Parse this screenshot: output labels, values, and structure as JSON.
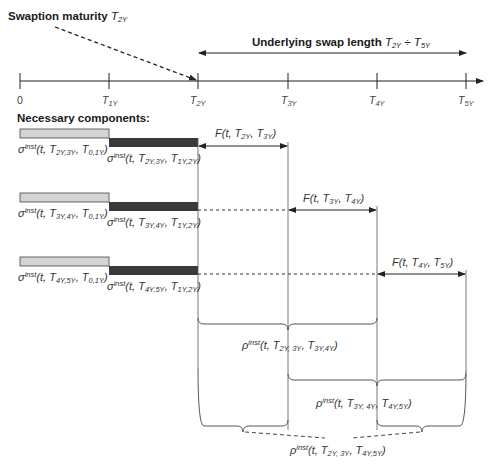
{
  "title": {
    "swaption_maturity_text": "Swaption maturity",
    "swaption_maturity_symbol": "T",
    "swaption_maturity_sub": "2Y",
    "underlying_text": "Underlying swap length",
    "underlying_from": "T",
    "underlying_from_sub": "2Y",
    "underlying_sep": " ÷ ",
    "underlying_to": "T",
    "underlying_to_sub": "5Y"
  },
  "axis": {
    "ticks": [
      {
        "label": "0",
        "sub": ""
      },
      {
        "label": "T",
        "sub": "1Y"
      },
      {
        "label": "T",
        "sub": "2Y"
      },
      {
        "label": "T",
        "sub": "3Y"
      },
      {
        "label": "T",
        "sub": "4Y"
      },
      {
        "label": "T",
        "sub": "5Y"
      }
    ]
  },
  "components_heading": "Necessary components:",
  "rows": [
    {
      "sigma1": {
        "pre": "σ",
        "sup": "inst",
        "args": "(t, T",
        "s1": "2Y,3Y",
        "mid": ", T",
        "s2": "0,1Y",
        "end": ")"
      },
      "sigma2": {
        "pre": "σ",
        "sup": "inst",
        "args": "(t, T",
        "s1": "2Y,3Y",
        "mid": ", T",
        "s2": "1Y,2Y",
        "end": ")"
      },
      "forward": {
        "pre": "F(t, T",
        "s1": "2Y",
        "mid": ", T",
        "s2": "3Y",
        "end": ")"
      }
    },
    {
      "sigma1": {
        "pre": "σ",
        "sup": "inst",
        "args": "(t, T",
        "s1": "3Y,4Y",
        "mid": ", T",
        "s2": "0,1Y",
        "end": ")"
      },
      "sigma2": {
        "pre": "σ",
        "sup": "inst",
        "args": "(t, T",
        "s1": "3Y,4Y",
        "mid": ", T",
        "s2": "1Y,2Y",
        "end": ")"
      },
      "forward": {
        "pre": "F(t, T",
        "s1": "3Y",
        "mid": ", T",
        "s2": "4Y",
        "end": ")"
      }
    },
    {
      "sigma1": {
        "pre": "σ",
        "sup": "inst",
        "args": "(t, T",
        "s1": "4Y,5Y",
        "mid": ", T",
        "s2": "0,1Y",
        "end": ")"
      },
      "sigma2": {
        "pre": "σ",
        "sup": "inst",
        "args": "(t, T",
        "s1": "4Y,5Y",
        "mid": ", T",
        "s2": "1Y,2Y",
        "end": ")"
      },
      "forward": {
        "pre": "F(t, T",
        "s1": "4Y",
        "mid": ", T",
        "s2": "5Y",
        "end": ")"
      }
    }
  ],
  "correlations": [
    {
      "pre": "ρ",
      "sup": "inst",
      "args": "(t, T",
      "s1": "2Y, 3Y",
      "mid": ", T",
      "s2": "3Y,4Y",
      "end": ")"
    },
    {
      "pre": "ρ",
      "sup": "inst",
      "args": "(t, T",
      "s1": "3Y, 4Y",
      "mid": ", T",
      "s2": "4Y,5Y",
      "end": ")"
    },
    {
      "pre": "ρ",
      "sup": "inst",
      "args": "(t, T",
      "s1": "2Y, 3Y",
      "mid": ", T",
      "s2": "4Y,5Y",
      "end": ")"
    }
  ],
  "colors": {
    "light_bar": "#d4d4d4",
    "dark_bar": "#3a3a3a",
    "line": "#333333"
  }
}
